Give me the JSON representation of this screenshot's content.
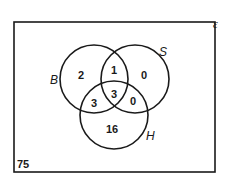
{
  "diagram": {
    "type": "venn",
    "universal_set": {
      "symbol": "ε",
      "outside_count": "75"
    },
    "sets": [
      {
        "label": "B"
      },
      {
        "label": "S"
      },
      {
        "label": "H"
      }
    ],
    "regions": {
      "B_only": "2",
      "S_only": "0",
      "H_only": "16",
      "B_and_S_only": "1",
      "B_and_H_only": "3",
      "S_and_H_only": "0",
      "B_and_S_and_H": "3"
    },
    "colors": {
      "stroke": "#1a1a1a",
      "background": "#ffffff"
    }
  }
}
